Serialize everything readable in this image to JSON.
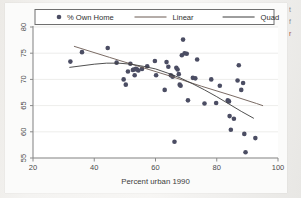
{
  "figure": {
    "name": "scatterplot-with-linear-and-quadratic-fits",
    "background_color": "#f2f2f0",
    "plot_background_color": "#fbfbfa"
  },
  "margin_text": {
    "line1": "t",
    "line2": "f",
    "line3": "r"
  },
  "chart_data": {
    "type": "scatter",
    "title": "",
    "subtitle": "",
    "xlabel": "Percent urban 1990",
    "ylabel": "",
    "xlim": [
      20,
      100
    ],
    "ylim": [
      55,
      80
    ],
    "xticks": [
      20,
      40,
      60,
      80,
      100
    ],
    "yticks": [
      55,
      60,
      65,
      70,
      75,
      80
    ],
    "xtick_labels": [
      "20",
      "40",
      "60",
      "80",
      "100"
    ],
    "ytick_labels": [
      "55",
      "60",
      "65",
      "70",
      "75",
      "80"
    ],
    "grid": "horizontal",
    "grid_color": "#e8e8e6",
    "axis_color": "#8a8a8a",
    "marker_color": "#4b4d63",
    "marker_size": 4.6,
    "legend_position": "top",
    "legend_entries": [
      {
        "label": "% Own Home",
        "type": "marker",
        "color": "#4b4d63"
      },
      {
        "label": "Linear",
        "type": "line",
        "color": "#6b5a52"
      },
      {
        "label": "Quad",
        "type": "line",
        "color": "#3c3c3c"
      }
    ],
    "series": [
      {
        "name": "% Own Home",
        "type": "scatter",
        "points": [
          [
            32.2,
            73.4
          ],
          [
            36.0,
            75.2
          ],
          [
            44.4,
            76.0
          ],
          [
            47.3,
            73.2
          ],
          [
            49.6,
            70.0
          ],
          [
            50.3,
            69.0
          ],
          [
            51.0,
            71.5
          ],
          [
            51.8,
            73.0
          ],
          [
            52.6,
            71.8
          ],
          [
            52.9,
            71.9
          ],
          [
            53.2,
            70.8
          ],
          [
            53.6,
            72.0
          ],
          [
            54.0,
            71.9
          ],
          [
            54.4,
            71.7
          ],
          [
            55.6,
            72.0
          ],
          [
            57.3,
            72.5
          ],
          [
            59.8,
            73.5
          ],
          [
            60.2,
            70.8
          ],
          [
            63.0,
            68.0
          ],
          [
            63.6,
            73.3
          ],
          [
            64.2,
            72.4
          ],
          [
            65.0,
            70.8
          ],
          [
            65.6,
            70.5
          ],
          [
            66.2,
            58.1
          ],
          [
            66.8,
            72.2
          ],
          [
            67.2,
            71.9
          ],
          [
            67.6,
            71.0
          ],
          [
            67.9,
            69.0
          ],
          [
            68.2,
            68.8
          ],
          [
            68.6,
            74.6
          ],
          [
            69.0,
            77.6
          ],
          [
            69.5,
            75.0
          ],
          [
            70.2,
            74.9
          ],
          [
            70.6,
            66.0
          ],
          [
            72.2,
            70.3
          ],
          [
            73.0,
            70.2
          ],
          [
            73.6,
            73.8
          ],
          [
            76.0,
            65.4
          ],
          [
            78.2,
            70.0
          ],
          [
            79.8,
            65.5
          ],
          [
            81.0,
            68.8
          ],
          [
            83.6,
            66.0
          ],
          [
            84.0,
            65.8
          ],
          [
            84.2,
            63.0
          ],
          [
            84.6,
            60.4
          ],
          [
            85.6,
            62.5
          ],
          [
            86.8,
            69.8
          ],
          [
            87.2,
            72.7
          ],
          [
            88.0,
            68.0
          ],
          [
            88.6,
            69.3
          ],
          [
            89.0,
            59.6
          ],
          [
            89.4,
            56.1
          ],
          [
            92.6,
            58.8
          ]
        ]
      },
      {
        "name": "Linear",
        "type": "line",
        "color": "#6b5a52",
        "points": [
          [
            33.5,
            76.3
          ],
          [
            45.0,
            74.2
          ],
          [
            55.0,
            72.4
          ],
          [
            65.0,
            70.6
          ],
          [
            75.0,
            68.7
          ],
          [
            85.0,
            66.9
          ],
          [
            93.0,
            65.4
          ],
          [
            95.0,
            65.0
          ]
        ]
      },
      {
        "name": "Quad",
        "type": "line",
        "color": "#3c3c3c",
        "points": [
          [
            32.0,
            72.3
          ],
          [
            36.0,
            72.6
          ],
          [
            40.0,
            72.9
          ],
          [
            44.0,
            73.1
          ],
          [
            48.0,
            73.1
          ],
          [
            52.0,
            72.9
          ],
          [
            56.0,
            72.5
          ],
          [
            60.0,
            72.0
          ],
          [
            64.0,
            71.2
          ],
          [
            68.0,
            70.3
          ],
          [
            72.0,
            69.2
          ],
          [
            76.0,
            68.0
          ],
          [
            80.0,
            66.7
          ],
          [
            84.0,
            65.3
          ],
          [
            88.0,
            63.9
          ],
          [
            92.0,
            62.6
          ]
        ]
      }
    ]
  }
}
